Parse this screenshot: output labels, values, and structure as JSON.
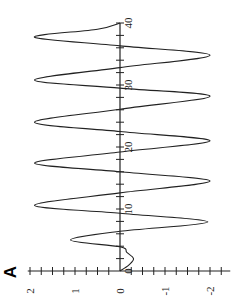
{
  "panel_label": "A",
  "chart_data": {
    "type": "line",
    "title": "",
    "orientation": "rotated-90",
    "xlabel": "",
    "ylabel": "",
    "xlim": [
      0,
      40
    ],
    "ylim": [
      -2.2,
      2.2
    ],
    "grid": false,
    "legend": null,
    "x_ticks": [
      0,
      10,
      20,
      30,
      40
    ],
    "x_tick_labels": [
      "0",
      "10",
      "20",
      "30",
      "40"
    ],
    "y_ticks": [
      2,
      1,
      0,
      -1,
      -2
    ],
    "y_tick_labels": [
      "2",
      "1",
      "0",
      "-1",
      "-2"
    ],
    "series": [
      {
        "name": "signal",
        "color": "#222222",
        "x": [
          0,
          1,
          2,
          3,
          3.9,
          5,
          6.4,
          7.9,
          9.3,
          10.6,
          12.6,
          14.5,
          16.0,
          17.4,
          19.2,
          21.0,
          22.5,
          24.0,
          26.1,
          28.2,
          29.5,
          30.8,
          32.8,
          34.8,
          36.3,
          37.7,
          39.0,
          40
        ],
        "values": [
          0,
          -0.2,
          -0.3,
          -0.15,
          0,
          1.1,
          0,
          -1.95,
          0,
          1.9,
          0,
          -2.0,
          0,
          1.9,
          0,
          -2.0,
          0,
          1.9,
          0,
          -2.0,
          0,
          1.9,
          0,
          -2.0,
          0,
          1.9,
          0.5,
          0
        ]
      }
    ]
  }
}
